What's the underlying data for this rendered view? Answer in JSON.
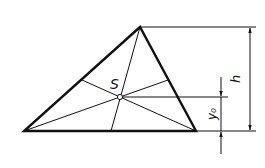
{
  "diagram": {
    "type": "triangle-centroid",
    "labels": {
      "centroid": "S",
      "height": "h",
      "centroid_height": "y₀"
    },
    "vertices": {
      "A": [
        24,
        131
      ],
      "B": [
        196,
        131
      ],
      "C": [
        140,
        27
      ]
    },
    "centroid": [
      120,
      97
    ],
    "colors": {
      "stroke": "#111111",
      "background": "#ffffff"
    }
  }
}
